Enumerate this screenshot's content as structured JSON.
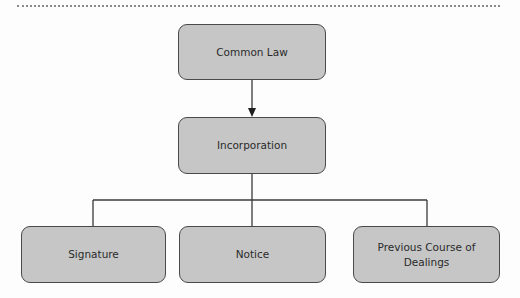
{
  "diagram": {
    "type": "hierarchy",
    "colors": {
      "node_fill": "#c6c6c6",
      "node_border": "#4a4a4a",
      "line": "#3a3a3a",
      "text": "#2a2a2a"
    },
    "nodes": {
      "root": {
        "id": "common-law",
        "label": "Common Law"
      },
      "middle": {
        "id": "incorporation",
        "label": "Incorporation"
      },
      "children": [
        {
          "id": "signature",
          "label": "Signature"
        },
        {
          "id": "notice",
          "label": "Notice"
        },
        {
          "id": "previous-course",
          "label": "Previous Course of Dealings"
        }
      ]
    },
    "edges": [
      {
        "from": "common-law",
        "to": "incorporation",
        "style": "arrow"
      },
      {
        "from": "incorporation",
        "to": "signature",
        "style": "line"
      },
      {
        "from": "incorporation",
        "to": "notice",
        "style": "line"
      },
      {
        "from": "incorporation",
        "to": "previous-course",
        "style": "line"
      }
    ]
  }
}
